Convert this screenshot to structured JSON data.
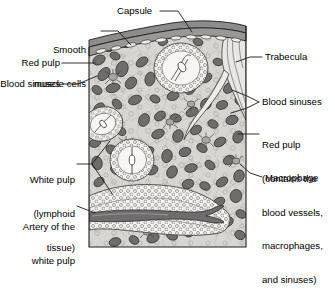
{
  "figure": {
    "colors": {
      "background": "#ffffff",
      "outline": "#1a1a1a",
      "capsule_fill": "#8c8c8c",
      "red_pulp_fill": "#d6d4d2",
      "sinus_fill": "#777777",
      "white_pulp_fill": "#f2f1ef",
      "artery_fill": "#6e6c6c",
      "leader_line": "#1a1a1a",
      "text": "#000000"
    }
  },
  "labels": [
    {
      "id": "capsule",
      "name": "label-capsule",
      "text": "Capsule",
      "lines": [
        "Capsule"
      ],
      "align": "left",
      "x": 117,
      "y": 6
    },
    {
      "id": "smooth-muscle-cells",
      "name": "label-smooth-muscle-cells",
      "text": "Smooth muscle cells",
      "lines": [
        "Smooth",
        "muscle cells"
      ],
      "align": "right",
      "x": 18,
      "y": 25
    },
    {
      "id": "red-pulp-left",
      "name": "label-red-pulp-left",
      "text": "Red pulp",
      "lines": [
        "Red pulp"
      ],
      "align": "right",
      "x": 12,
      "y": 58
    },
    {
      "id": "blood-sinuses-left",
      "name": "label-blood-sinuses-left",
      "text": "Blood sinuses",
      "lines": [
        "Blood sinuses"
      ],
      "align": "right",
      "x": 2,
      "y": 79
    },
    {
      "id": "white-pulp",
      "name": "label-white-pulp",
      "text": "White pulp (lymphoid tissue)",
      "lines": [
        "White pulp",
        "(lymphoid",
        "tissue)"
      ],
      "align": "right",
      "x": 8,
      "y": 160
    },
    {
      "id": "artery-of-white-pulp",
      "name": "label-artery-of-white-pulp",
      "text": "Artery of the white pulp",
      "lines": [
        "Artery of the",
        "white pulp"
      ],
      "align": "right",
      "x": 8,
      "y": 202
    },
    {
      "id": "trabecula",
      "name": "label-trabecula",
      "text": "Trabecula",
      "lines": [
        "Trabecula"
      ],
      "align": "left",
      "x": 265,
      "y": 52
    },
    {
      "id": "blood-sinuses-right",
      "name": "label-blood-sinuses-right",
      "text": "Blood sinuses",
      "lines": [
        "Blood sinuses"
      ],
      "align": "left",
      "x": 262,
      "y": 97
    },
    {
      "id": "red-pulp-right",
      "name": "label-red-pulp-right",
      "text": "Red pulp (contains the blood vessels, macrophages, and sinuses)",
      "lines": [
        "Red pulp",
        "(contains the",
        "blood vessels,",
        "macrophages,",
        "and sinuses)"
      ],
      "align": "left",
      "x": 262,
      "y": 118
    },
    {
      "id": "macrophage",
      "name": "label-macrophage",
      "text": "Macrophage",
      "lines": [
        "Macrophage"
      ],
      "align": "left",
      "x": 265,
      "y": 173
    }
  ],
  "structures": [
    {
      "name": "capsule",
      "description": "Dark gray fibrous outer band across the top containing elongated smooth muscle cell nuclei"
    },
    {
      "name": "smooth-muscle-cells",
      "description": "Elongated light nuclei embedded within the capsule band"
    },
    {
      "name": "trabecula",
      "description": "Pale striated connective tissue band extending inward from the capsule at the upper right"
    },
    {
      "name": "red-pulp",
      "description": "Light gray ground tissue filled with dark gray blood sinus profiles"
    },
    {
      "name": "blood-sinuses",
      "description": "Dark gray irregular blobs scattered through the red pulp"
    },
    {
      "name": "white-pulp-nodules",
      "description": "Rounded lymphoid nodules outlined by rings of small lymphocyte circles, each with a central arteriole"
    },
    {
      "name": "white-pulp-band",
      "description": "Broad stippled lymphoid sheath crossing the lower third of the section"
    },
    {
      "name": "artery-of-white-pulp",
      "description": "Dark gray central artery running lengthwise within the white pulp band"
    },
    {
      "name": "macrophage",
      "description": "Star shaped cells with radiating processes scattered in the red pulp"
    }
  ]
}
